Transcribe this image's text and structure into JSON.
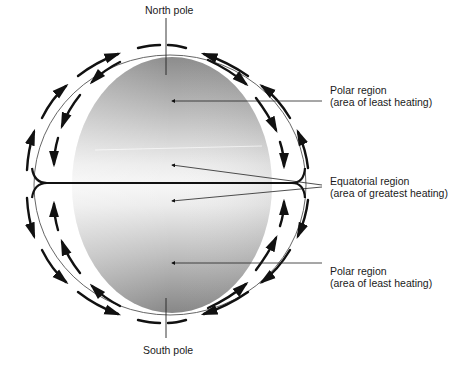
{
  "diagram": {
    "labels": {
      "north_pole": "North pole",
      "south_pole": "South pole",
      "polar_top": {
        "line1": "Polar region",
        "line2": "(area of least heating)"
      },
      "equatorial": {
        "line1": "Equatorial region",
        "line2": "(area of greatest heating)"
      },
      "polar_bottom": {
        "line1": "Polar region",
        "line2": "(area of least heating)"
      }
    },
    "colors": {
      "globe_dark": "#8a8a8a",
      "globe_light": "#f4f4f4",
      "line": "#111111",
      "outline": "#555555"
    }
  }
}
